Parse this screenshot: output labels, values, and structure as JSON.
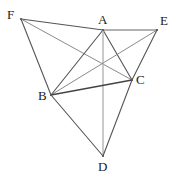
{
  "figure": {
    "width": 181,
    "height": 185,
    "background_color": "#ffffff",
    "default_edge_color": "#555555",
    "light_edge_color": "#b3b3b3",
    "label_color": "#1a1a1a",
    "vertices": [
      {
        "id": "F",
        "label": "F",
        "x": 21,
        "y": 19,
        "label_x": 7,
        "label_y": 8
      },
      {
        "id": "A",
        "label": "A",
        "x": 103,
        "y": 30,
        "label_x": 98,
        "label_y": 13
      },
      {
        "id": "E",
        "label": "E",
        "x": 157,
        "y": 30,
        "label_x": 160,
        "label_y": 14
      },
      {
        "id": "C",
        "label": "C",
        "x": 132,
        "y": 80,
        "label_x": 136,
        "label_y": 73
      },
      {
        "id": "B",
        "label": "B",
        "x": 51,
        "y": 95,
        "label_x": 38,
        "label_y": 89
      },
      {
        "id": "D",
        "label": "D",
        "x": 103,
        "y": 156,
        "label_x": 98,
        "label_y": 160
      }
    ],
    "edges": [
      {
        "id": "FA",
        "from": "F",
        "to": "A",
        "color": "#555555",
        "width": 1.1
      },
      {
        "id": "FB",
        "from": "F",
        "to": "B",
        "color": "#555555",
        "width": 1.1
      },
      {
        "id": "FC",
        "from": "F",
        "to": "C",
        "color": "#8a8a8a",
        "width": 1.0
      },
      {
        "id": "AE",
        "from": "A",
        "to": "E",
        "color": "#999999",
        "width": 1.3
      },
      {
        "id": "AB",
        "from": "A",
        "to": "B",
        "color": "#555555",
        "width": 1.1
      },
      {
        "id": "AC",
        "from": "A",
        "to": "C",
        "color": "#555555",
        "width": 1.1
      },
      {
        "id": "AD",
        "from": "A",
        "to": "D",
        "color": "#b3b3b3",
        "width": 1.4
      },
      {
        "id": "EB",
        "from": "E",
        "to": "B",
        "color": "#8a8a8a",
        "width": 1.0
      },
      {
        "id": "EC",
        "from": "E",
        "to": "C",
        "color": "#555555",
        "width": 1.1
      },
      {
        "id": "BC",
        "from": "B",
        "to": "C",
        "color": "#444444",
        "width": 1.3
      },
      {
        "id": "BD",
        "from": "B",
        "to": "D",
        "color": "#555555",
        "width": 1.1
      },
      {
        "id": "CD",
        "from": "C",
        "to": "D",
        "color": "#555555",
        "width": 1.1
      }
    ]
  },
  "chart_data": {
    "type": "diagram",
    "points": {
      "F": [
        21,
        19
      ],
      "A": [
        103,
        30
      ],
      "E": [
        157,
        30
      ],
      "C": [
        132,
        80
      ],
      "B": [
        51,
        95
      ],
      "D": [
        103,
        156
      ]
    },
    "segments": [
      "F-A",
      "F-B",
      "F-C",
      "A-E",
      "A-B",
      "A-C",
      "A-D",
      "E-B",
      "E-C",
      "B-C",
      "B-D",
      "C-D"
    ],
    "labels": [
      "F",
      "A",
      "E",
      "C",
      "B",
      "D"
    ]
  }
}
